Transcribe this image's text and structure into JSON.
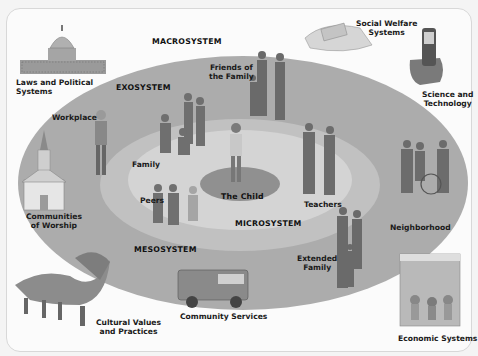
{
  "diagram": {
    "systems": {
      "macro": "MACROSYSTEM",
      "exo": "EXOSYSTEM",
      "meso": "MESOSYSTEM",
      "micro": "MICROSYSTEM",
      "center": "The Child"
    },
    "macro_items": [
      {
        "label": "Laws and Political\nSystems",
        "icon": "capitol-building-icon"
      },
      {
        "label": "Social Welfare\nSystems",
        "icon": "money-hand-icon"
      },
      {
        "label": "Science and\nTechnology",
        "icon": "cellphone-icon"
      },
      {
        "label": "Cultural Values\nand Practices",
        "icon": "dragon-dance-icon"
      },
      {
        "label": "Economic Systems",
        "icon": "shop-icon"
      }
    ],
    "exo_items": [
      {
        "label": "Workplace",
        "icon": "worker-icon"
      },
      {
        "label": "Friends of\nthe Family",
        "icon": "friends-icon"
      },
      {
        "label": "Communities\nof Worship",
        "icon": "church-icon"
      },
      {
        "label": "Neighborhood",
        "icon": "neighbors-icon"
      },
      {
        "label": "Extended\nFamily",
        "icon": "extended-family-icon"
      },
      {
        "label": "Community Services",
        "icon": "fire-truck-icon"
      }
    ],
    "micro_items": [
      {
        "label": "Family",
        "icon": "family-icon"
      },
      {
        "label": "Peers",
        "icon": "peers-icon"
      },
      {
        "label": "Teachers",
        "icon": "teachers-icon"
      }
    ],
    "colors": {
      "background": "#fbfbfb",
      "exo_fill": "#a9a9a9",
      "meso_fill": "#bdbdbd",
      "micro_fill": "#d2d2d2",
      "child_fill": "#8e8e8e"
    }
  }
}
